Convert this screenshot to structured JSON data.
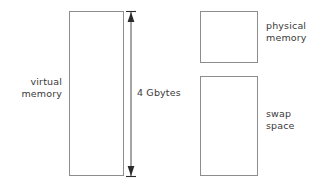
{
  "diagram": {
    "background_color": "#ffffff",
    "stroke_color": "#8d8d8d",
    "text_color": "#3a3a3a",
    "boxes": [
      {
        "id": "virtual-memory",
        "label": "virtual\nmemory",
        "label_position": "left",
        "x": 69,
        "y": 11,
        "width": 55,
        "height": 165
      },
      {
        "id": "physical-memory",
        "label": "physical\nmemory",
        "label_position": "right",
        "x": 200,
        "y": 11,
        "width": 58,
        "height": 52
      },
      {
        "id": "swap-space",
        "label": "swap\nspace",
        "label_position": "right",
        "x": 200,
        "y": 76,
        "width": 58,
        "height": 100
      }
    ],
    "annotation": {
      "id": "size-annotation",
      "text": "4 Gbytes",
      "measures": "virtual-memory",
      "arrow": "double-headed-vertical",
      "x": 131,
      "y_top": 11,
      "y_bottom": 176
    }
  }
}
